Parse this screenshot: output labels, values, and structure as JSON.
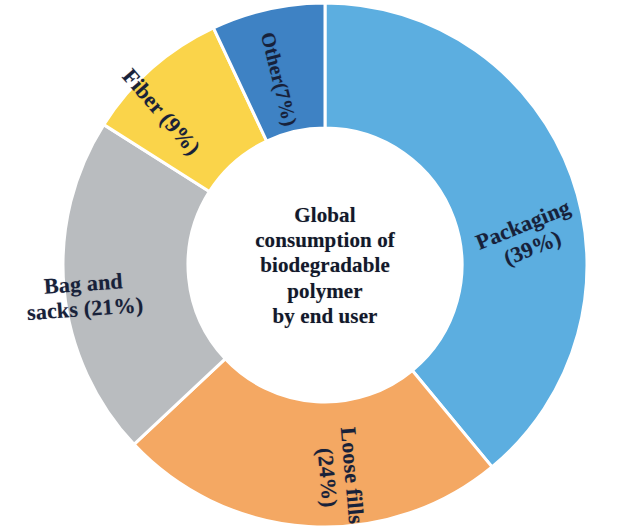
{
  "chart_data": {
    "type": "pie",
    "variant": "donut",
    "title": "Global consumption of biodegradable polymer by end user",
    "title_lines": [
      "Global",
      "consumption of",
      "biodegradable",
      "polymer",
      "by end user"
    ],
    "title_position": "center",
    "unit": "%",
    "start_angle_deg": 0,
    "direction": "clockwise",
    "legend": "none",
    "labels_inside_slices": true,
    "categories": [
      "Packaging",
      "Loose fills",
      "Bag and sacks",
      "Fiber",
      "Other"
    ],
    "values": [
      39,
      24,
      21,
      9,
      7
    ],
    "colors": [
      "#5CAEE0",
      "#F4A863",
      "#B9BCBF",
      "#FAD44A",
      "#3E82C4"
    ],
    "slices": [
      {
        "name": "Packaging",
        "value": 39,
        "label": "Packaging",
        "percent_label": "(39%)",
        "color": "#5CAEE0",
        "start_deg": 0,
        "end_deg": 140.4,
        "label_lines": [
          "Packaging",
          "(39%)"
        ],
        "label_rotation_deg": -22,
        "label_x": 478,
        "label_y": 212
      },
      {
        "name": "Loose fills",
        "value": 24,
        "label": "Loose fills",
        "percent_label": "(24%)",
        "color": "#F4A863",
        "start_deg": 140.4,
        "end_deg": 226.8,
        "label_lines": [
          "Loose fills",
          "(24%)"
        ],
        "label_rotation_deg": 85,
        "label_x": 291,
        "label_y": 452
      },
      {
        "name": "Bag and sacks",
        "value": 21,
        "label": "Bag and sacks",
        "percent_label": "(21%)",
        "color": "#B9BCBF",
        "start_deg": 226.8,
        "end_deg": 302.4,
        "label_lines": [
          "Bag and",
          "sacks (21%)"
        ],
        "label_rotation_deg": -4,
        "label_x": 26,
        "label_y": 272
      },
      {
        "name": "Fiber",
        "value": 9,
        "label": "Fiber",
        "percent_label": "(9%)",
        "color": "#FAD44A",
        "start_deg": 302.4,
        "end_deg": 334.8,
        "label_lines": [
          "Fiber (9%)"
        ],
        "label_rotation_deg": 49,
        "label_x": 108,
        "label_y": 100
      },
      {
        "name": "Other",
        "value": 7,
        "label": "Other",
        "percent_label": "(7%)",
        "color": "#3E82C4",
        "start_deg": 334.8,
        "end_deg": 360,
        "label_lines": [
          "Other(7%)"
        ],
        "label_rotation_deg": 76,
        "label_x": 231,
        "label_y": 68
      }
    ],
    "geometry": {
      "center_x": 325,
      "center_y": 265,
      "outer_radius": 262,
      "inner_radius": 137,
      "separator_color": "#ffffff",
      "separator_width": 3
    },
    "background_color": "#ffffff",
    "grid": false,
    "xlabel": "",
    "ylabel": ""
  }
}
